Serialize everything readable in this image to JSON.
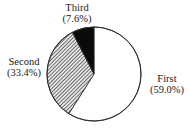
{
  "chart_data": {
    "type": "pie",
    "title": "",
    "start_angle_deg": 0,
    "direction": "clockwise",
    "center": [
      94,
      74
    ],
    "radius": 47,
    "slices": [
      {
        "name": "First",
        "value": 59.0,
        "label": "First",
        "pct_label": "(59.0%)",
        "fill": "white",
        "label_pos": [
          167,
          82
        ]
      },
      {
        "name": "Second",
        "value": 33.4,
        "label": "Second",
        "pct_label": "(33.4%)",
        "fill": "hatch",
        "label_pos": [
          24,
          65
        ]
      },
      {
        "name": "Third",
        "value": 7.6,
        "label": "Third",
        "pct_label": "(7.6%)",
        "fill": "black",
        "label_pos": [
          77,
          11
        ]
      }
    ],
    "categories": [
      "First",
      "Second",
      "Third"
    ],
    "values": [
      59.0,
      33.4,
      7.6
    ],
    "legend": "none (labels placed beside slices)"
  },
  "colors": {
    "outline": "#2a2a2a",
    "first": "#ffffff",
    "second_hatch_line": "#3a3a3a",
    "second_hatch_bg": "#d8d8d8",
    "third": "#0a0a0a"
  }
}
